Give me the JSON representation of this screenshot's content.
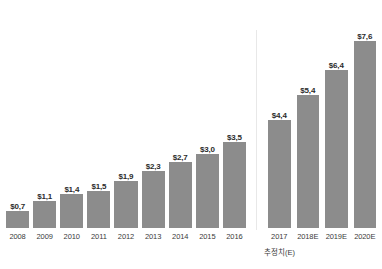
{
  "chart_data": {
    "type": "bar",
    "title": "",
    "subtitle": "",
    "xlabel": "",
    "ylabel": "",
    "grid": false,
    "legend": "none",
    "ylim": [
      0,
      8.2
    ],
    "orientation": "vertical",
    "bar_color": "#8c8c8c",
    "background_color": "#ffffff",
    "label_color": "#2b2b2b",
    "divider_color": "#e8e8e8",
    "groups": [
      {
        "name": "actual",
        "categories": [
          "2008",
          "2009",
          "2010",
          "2011",
          "2012",
          "2013",
          "2014",
          "2015",
          "2016"
        ],
        "values": [
          0.7,
          1.1,
          1.4,
          1.5,
          1.9,
          2.3,
          2.7,
          3.0,
          3.5
        ],
        "value_labels": [
          "$0,7",
          "$1,1",
          "$1,4",
          "$1,5",
          "$1,9",
          "$2,3",
          "$2,7",
          "$3,0",
          "$3,5"
        ]
      },
      {
        "name": "estimate",
        "categories": [
          "2017",
          "2018E",
          "2019E",
          "2020E"
        ],
        "values": [
          4.4,
          5.4,
          6.4,
          7.6
        ],
        "value_labels": [
          "$4,4",
          "$5,4",
          "$6,4",
          "$7,6"
        ]
      }
    ],
    "categories": [
      "2008",
      "2009",
      "2010",
      "2011",
      "2012",
      "2013",
      "2014",
      "2015",
      "2016",
      "2017",
      "2018E",
      "2019E",
      "2020E"
    ],
    "values": [
      0.7,
      1.1,
      1.4,
      1.5,
      1.9,
      2.3,
      2.7,
      3.0,
      3.5,
      4.4,
      5.4,
      6.4,
      7.6
    ],
    "annotations": [
      {
        "text": "추정치(E)",
        "position": "below-right-group"
      }
    ]
  },
  "footnote": {
    "text": "추정치(E)"
  }
}
